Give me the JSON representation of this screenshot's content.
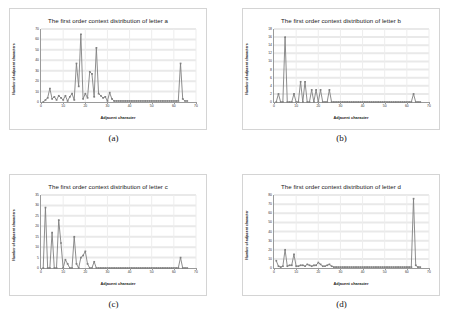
{
  "figure": {
    "panels": [
      {
        "caption": "(a)",
        "title": "The first order context distribution of letter a",
        "xlabel": "Adjacent character",
        "ylabel": "Number of adjacent characters"
      },
      {
        "caption": "(b)",
        "title": "The first order context distribution of letter b",
        "xlabel": "Adjacent character",
        "ylabel": "Number of adjacent characters"
      },
      {
        "caption": "(c)",
        "title": "The first order context distribution of letter c",
        "xlabel": "Adjacent character",
        "ylabel": "Number of adjacent characters"
      },
      {
        "caption": "(d)",
        "title": "The first order context distribution of letter d",
        "xlabel": "Adjacent character",
        "ylabel": "Number of adjacent character"
      }
    ]
  },
  "chart_data": [
    {
      "type": "line",
      "title": "The first order context distribution of letter a",
      "xlabel": "Adjacent character",
      "ylabel": "Number of adjacent characters",
      "xlim": [
        0,
        70
      ],
      "ylim": [
        0,
        70
      ],
      "xticks": [
        0,
        10,
        20,
        30,
        40,
        50,
        60,
        70
      ],
      "yticks": [
        0,
        10,
        20,
        30,
        40,
        50,
        60,
        70
      ],
      "grid": true,
      "markers": true,
      "color": "#808080",
      "x": [
        1,
        2,
        3,
        4,
        5,
        6,
        7,
        8,
        9,
        10,
        11,
        12,
        13,
        14,
        15,
        16,
        17,
        18,
        19,
        20,
        21,
        22,
        23,
        24,
        25,
        26,
        27,
        28,
        29,
        30,
        31,
        32,
        33,
        34,
        35,
        36,
        37,
        38,
        39,
        40,
        41,
        42,
        43,
        44,
        45,
        46,
        47,
        48,
        49,
        50,
        51,
        52,
        53,
        54,
        55,
        56,
        57,
        58,
        59,
        60,
        61,
        62,
        63,
        64,
        65,
        66
      ],
      "values": [
        0,
        2,
        4,
        13,
        3,
        5,
        2,
        6,
        4,
        2,
        6,
        1,
        5,
        8,
        2,
        37,
        15,
        65,
        3,
        8,
        4,
        29,
        27,
        5,
        52,
        8,
        6,
        4,
        5,
        1,
        9,
        3,
        1,
        1,
        1,
        1,
        1,
        1,
        1,
        1,
        1,
        1,
        1,
        1,
        1,
        1,
        1,
        1,
        1,
        1,
        1,
        1,
        1,
        1,
        1,
        1,
        1,
        1,
        1,
        1,
        1,
        1,
        37,
        3,
        1,
        1
      ]
    },
    {
      "type": "line",
      "title": "The first order context distribution of letter b",
      "xlabel": "Adjacent character",
      "ylabel": "Number of adjacent characters",
      "xlim": [
        0,
        70
      ],
      "ylim": [
        0,
        18
      ],
      "xticks": [
        0,
        10,
        20,
        30,
        40,
        50,
        60,
        70
      ],
      "yticks": [
        0,
        2,
        4,
        6,
        8,
        10,
        12,
        14,
        16,
        18
      ],
      "grid": true,
      "markers": true,
      "color": "#808080",
      "x": [
        1,
        2,
        3,
        4,
        5,
        6,
        7,
        8,
        9,
        10,
        11,
        12,
        13,
        14,
        15,
        16,
        17,
        18,
        19,
        20,
        21,
        22,
        23,
        24,
        25,
        26,
        27,
        28,
        29,
        30,
        31,
        32,
        33,
        34,
        35,
        36,
        37,
        38,
        39,
        40,
        41,
        42,
        43,
        44,
        45,
        46,
        47,
        48,
        49,
        50,
        51,
        52,
        53,
        54,
        55,
        56,
        57,
        58,
        59,
        60,
        61,
        62,
        63,
        64,
        65,
        66
      ],
      "values": [
        0,
        2,
        0,
        0,
        16,
        0,
        0,
        0,
        2,
        0,
        0,
        5,
        0,
        5,
        0,
        0,
        3,
        0,
        3,
        0,
        3,
        0,
        0,
        0,
        3,
        0,
        0,
        0,
        0,
        0,
        0,
        0,
        0,
        0,
        0,
        0,
        0,
        0,
        0,
        0,
        0,
        0,
        0,
        0,
        0,
        0,
        0,
        0,
        0,
        0,
        0,
        0,
        0,
        0,
        0,
        0,
        0,
        0,
        0,
        0,
        0,
        0,
        2,
        0,
        0,
        0
      ]
    },
    {
      "type": "line",
      "title": "The first order context distribution of letter c",
      "xlabel": "Adjacent character",
      "ylabel": "Number of adjacent characters",
      "xlim": [
        0,
        70
      ],
      "ylim": [
        0,
        35
      ],
      "xticks": [
        0,
        10,
        20,
        30,
        40,
        50,
        60,
        70
      ],
      "yticks": [
        0,
        5,
        10,
        15,
        20,
        25,
        30,
        35
      ],
      "grid": true,
      "markers": true,
      "color": "#808080",
      "x": [
        1,
        2,
        3,
        4,
        5,
        6,
        7,
        8,
        9,
        10,
        11,
        12,
        13,
        14,
        15,
        16,
        17,
        18,
        19,
        20,
        21,
        22,
        23,
        24,
        25,
        26,
        27,
        28,
        29,
        30,
        31,
        32,
        33,
        34,
        35,
        36,
        37,
        38,
        39,
        40,
        41,
        42,
        43,
        44,
        45,
        46,
        47,
        48,
        49,
        50,
        51,
        52,
        53,
        54,
        55,
        56,
        57,
        58,
        59,
        60,
        61,
        62,
        63,
        64,
        65,
        66
      ],
      "values": [
        0,
        29,
        0,
        0,
        17,
        0,
        0,
        23,
        12,
        0,
        4,
        2,
        0,
        0,
        15,
        2,
        0,
        5,
        6,
        8,
        2,
        0,
        0,
        3,
        0,
        0,
        0,
        0,
        0,
        0,
        0,
        0,
        0,
        0,
        0,
        0,
        0,
        0,
        0,
        0,
        0,
        0,
        0,
        0,
        0,
        0,
        0,
        0,
        0,
        0,
        0,
        0,
        0,
        0,
        0,
        0,
        0,
        0,
        0,
        0,
        0,
        0,
        5,
        0,
        0,
        0
      ]
    },
    {
      "type": "line",
      "title": "The first order context distribution of letter d",
      "xlabel": "Adjacent character",
      "ylabel": "Number of adjacent character",
      "xlim": [
        0,
        70
      ],
      "ylim": [
        0,
        80
      ],
      "xticks": [
        0,
        10,
        20,
        30,
        40,
        50,
        60,
        70
      ],
      "yticks": [
        0,
        10,
        20,
        30,
        40,
        50,
        60,
        70,
        80
      ],
      "grid": true,
      "markers": true,
      "color": "#808080",
      "x": [
        1,
        2,
        3,
        4,
        5,
        6,
        7,
        8,
        9,
        10,
        11,
        12,
        13,
        14,
        15,
        16,
        17,
        18,
        19,
        20,
        21,
        22,
        23,
        24,
        25,
        26,
        27,
        28,
        29,
        30,
        31,
        32,
        33,
        34,
        35,
        36,
        37,
        38,
        39,
        40,
        41,
        42,
        43,
        44,
        45,
        46,
        47,
        48,
        49,
        50,
        51,
        52,
        53,
        54,
        55,
        56,
        57,
        58,
        59,
        60,
        61,
        62,
        63,
        64,
        65,
        66
      ],
      "values": [
        8,
        2,
        1,
        2,
        20,
        2,
        3,
        3,
        15,
        2,
        2,
        3,
        3,
        2,
        4,
        3,
        2,
        3,
        3,
        6,
        4,
        2,
        2,
        3,
        4,
        2,
        1,
        1,
        1,
        1,
        1,
        1,
        1,
        1,
        1,
        1,
        1,
        1,
        1,
        1,
        1,
        1,
        1,
        1,
        1,
        1,
        1,
        1,
        1,
        1,
        1,
        1,
        1,
        1,
        1,
        1,
        1,
        1,
        1,
        1,
        1,
        1,
        76,
        3,
        1,
        1
      ]
    }
  ]
}
